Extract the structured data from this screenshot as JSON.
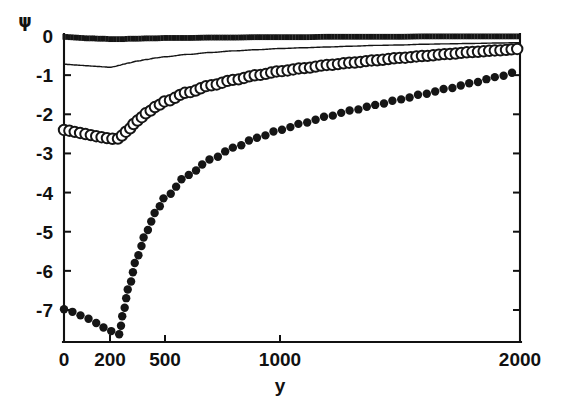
{
  "figure": {
    "width": 564,
    "height": 406,
    "background": "#ffffff",
    "ink_color": "#111111"
  },
  "chart_data": {
    "type": "line",
    "title": "",
    "xlabel": "y",
    "ylabel": "ψ",
    "ylabel_glyph": "ψ",
    "xlim": [
      0,
      2000
    ],
    "ylim": [
      -7.7,
      0.15
    ],
    "grid": false,
    "legend": "none",
    "x_axis_scale": "piecewise-compressed",
    "xticks": [
      0,
      200,
      500,
      1000,
      2000
    ],
    "xticklabels": [
      "0",
      "200",
      "500",
      "1000",
      "2000"
    ],
    "yticks": [
      0,
      -1,
      -2,
      -3,
      -4,
      -5,
      -6,
      -7
    ],
    "yticklabels": [
      "0",
      "-1",
      "-2",
      "-3",
      "-4",
      "-5",
      "-6",
      "-7"
    ],
    "x": [
      0,
      25,
      50,
      75,
      100,
      125,
      150,
      175,
      200,
      225,
      250,
      275,
      300,
      350,
      400,
      450,
      500,
      600,
      700,
      800,
      900,
      1000,
      1100,
      1200,
      1300,
      1400,
      1500,
      1600,
      1700,
      1800,
      1900,
      2000
    ],
    "series": [
      {
        "name": "curve-1",
        "marker": "dense-dots",
        "style": "thick-dotted",
        "linewidth": 5.5,
        "values": [
          -0.02,
          -0.03,
          -0.04,
          -0.05,
          -0.06,
          -0.06,
          -0.07,
          -0.07,
          -0.08,
          -0.08,
          -0.08,
          -0.08,
          -0.07,
          -0.07,
          -0.06,
          -0.06,
          -0.05,
          -0.05,
          -0.04,
          -0.04,
          -0.03,
          -0.03,
          -0.03,
          -0.02,
          -0.02,
          -0.02,
          -0.02,
          -0.01,
          -0.01,
          -0.01,
          -0.01,
          -0.01
        ]
      },
      {
        "name": "curve-2",
        "marker": "none",
        "style": "thin-solid",
        "linewidth": 1.4,
        "values": [
          -0.72,
          -0.73,
          -0.74,
          -0.75,
          -0.76,
          -0.77,
          -0.78,
          -0.79,
          -0.8,
          -0.78,
          -0.75,
          -0.72,
          -0.69,
          -0.64,
          -0.6,
          -0.56,
          -0.53,
          -0.47,
          -0.42,
          -0.38,
          -0.35,
          -0.32,
          -0.3,
          -0.28,
          -0.26,
          -0.24,
          -0.23,
          -0.21,
          -0.2,
          -0.19,
          -0.18,
          -0.17
        ]
      },
      {
        "name": "curve-3",
        "marker": "open-circle",
        "style": "circles",
        "markersize": 5.2,
        "values": [
          -2.4,
          -2.42,
          -2.45,
          -2.48,
          -2.51,
          -2.54,
          -2.57,
          -2.6,
          -2.62,
          -2.63,
          -2.62,
          -2.5,
          -2.38,
          -2.16,
          -1.97,
          -1.81,
          -1.67,
          -1.44,
          -1.26,
          -1.12,
          -1.0,
          -0.9,
          -0.82,
          -0.74,
          -0.68,
          -0.62,
          -0.56,
          -0.51,
          -0.46,
          -0.41,
          -0.37,
          -0.33
        ]
      },
      {
        "name": "curve-4",
        "marker": "filled-dot",
        "style": "dots",
        "markersize": 4.2,
        "values": [
          -6.98,
          -7.02,
          -7.08,
          -7.14,
          -7.21,
          -7.28,
          -7.36,
          -7.45,
          -7.53,
          -7.58,
          -7.62,
          -7.0,
          -6.45,
          -5.62,
          -4.98,
          -4.5,
          -4.12,
          -3.55,
          -3.15,
          -2.85,
          -2.6,
          -2.4,
          -2.22,
          -2.05,
          -1.9,
          -1.76,
          -1.62,
          -1.48,
          -1.34,
          -1.2,
          -1.05,
          -0.9
        ]
      }
    ]
  }
}
